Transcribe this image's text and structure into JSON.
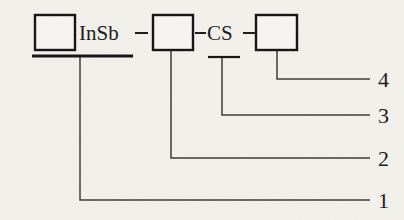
{
  "diagram": {
    "background_color": "#f2f1ec",
    "ink_color": "#131313",
    "boxes": [
      {
        "id": "box-1",
        "label": "",
        "x": 35,
        "y": 15,
        "w": 40,
        "h": 35
      },
      {
        "id": "box-2",
        "label": "",
        "x": 153,
        "y": 15,
        "w": 40,
        "h": 35
      },
      {
        "id": "box-3",
        "label": "",
        "x": 256,
        "y": 15,
        "w": 41,
        "h": 35
      }
    ],
    "material_labels": [
      {
        "id": "label-insb",
        "text": "InSb",
        "x": 79,
        "y": 40
      },
      {
        "id": "label-cs",
        "text": "CS",
        "x": 207,
        "y": 40
      }
    ],
    "connectors": [
      {
        "id": "dash-insb-box2",
        "x1": 135,
        "y1": 33,
        "x2": 148,
        "y2": 33
      },
      {
        "id": "dash-box2-cs",
        "x1": 195,
        "y1": 33,
        "x2": 206,
        "y2": 33
      },
      {
        "id": "dash-cs-box3",
        "x1": 243,
        "y1": 33,
        "x2": 255,
        "y2": 33
      }
    ],
    "rules": [
      {
        "id": "thick-rule-insb",
        "x1": 32,
        "y1": 56,
        "x2": 133,
        "y2": 56,
        "weight": "thick"
      },
      {
        "id": "thin-rule-cs",
        "x1": 208,
        "y1": 57,
        "x2": 240,
        "y2": 57,
        "weight": "thin"
      }
    ],
    "callouts": [
      {
        "id": "callout-4",
        "number": "4",
        "start_x": 277,
        "start_y": 50,
        "bend_x": 277,
        "bend_y": 79,
        "end_x": 370,
        "end_y": 79,
        "text_x": 378,
        "text_y": 87
      },
      {
        "id": "callout-3",
        "number": "3",
        "start_x": 222,
        "start_y": 57,
        "bend_x": 222,
        "bend_y": 115,
        "end_x": 370,
        "end_y": 115,
        "text_x": 378,
        "text_y": 123
      },
      {
        "id": "callout-2",
        "number": "2",
        "start_x": 171,
        "start_y": 50,
        "bend_x": 171,
        "bend_y": 158,
        "end_x": 370,
        "end_y": 158,
        "text_x": 378,
        "text_y": 166
      },
      {
        "id": "callout-1",
        "number": "1",
        "start_x": 80,
        "start_y": 56,
        "bend_x": 80,
        "bend_y": 200,
        "end_x": 370,
        "end_y": 200,
        "text_x": 378,
        "text_y": 208
      }
    ]
  }
}
